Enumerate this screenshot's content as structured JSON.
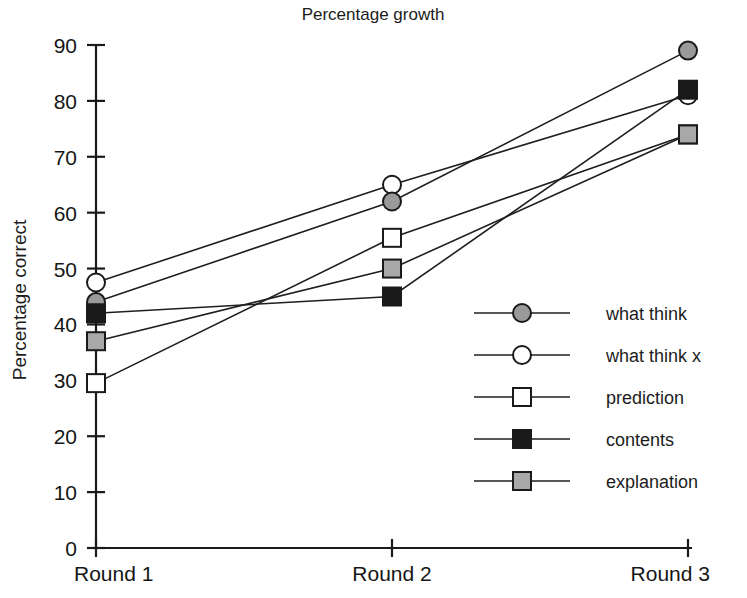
{
  "chart_data": {
    "type": "line",
    "title": "Percentage growth",
    "xlabel": "",
    "ylabel": "Percentage correct",
    "categories": [
      "Round 1",
      "Round 2",
      "Round 3"
    ],
    "ylim": [
      0,
      90
    ],
    "yticks": [
      0,
      10,
      20,
      30,
      40,
      50,
      60,
      70,
      80,
      90
    ],
    "grid": false,
    "legend_position": "center-right",
    "series": [
      {
        "name": "what think",
        "marker": "filled-gray-circle",
        "color": "#9a9a9a",
        "values": [
          44,
          62,
          89
        ]
      },
      {
        "name": "what think x",
        "marker": "open-circle",
        "color": "#ffffff",
        "values": [
          47.5,
          65,
          81
        ]
      },
      {
        "name": "prediction",
        "marker": "open-square",
        "color": "#ffffff",
        "values": [
          29.5,
          55.5,
          74
        ]
      },
      {
        "name": "contents",
        "marker": "filled-black-square",
        "color": "#1a1a1a",
        "values": [
          42,
          45,
          82
        ]
      },
      {
        "name": "explanation",
        "marker": "filled-gray-square",
        "color": "#a8a8a8",
        "values": [
          37,
          50,
          74
        ]
      }
    ]
  },
  "axis": {
    "y_tick_labels": [
      "90",
      "80",
      "70",
      "60",
      "50",
      "40",
      "30",
      "20",
      "10",
      "0"
    ],
    "y_title": "Percentage correct",
    "x_tick_labels": [
      "Round 1",
      "Round 2",
      "Round 3"
    ]
  },
  "legend": {
    "entries": [
      {
        "label": "what think"
      },
      {
        "label": "what think x"
      },
      {
        "label": "prediction"
      },
      {
        "label": "contents"
      },
      {
        "label": "explanation"
      }
    ]
  },
  "colors": {
    "axis": "#1a1a1a",
    "line": "#1f1f1f",
    "gray_circle_fill": "#9a9a9a",
    "gray_square_fill": "#a8a8a8",
    "black_fill": "#1a1a1a",
    "open_fill": "#ffffff",
    "background": "#ffffff"
  }
}
